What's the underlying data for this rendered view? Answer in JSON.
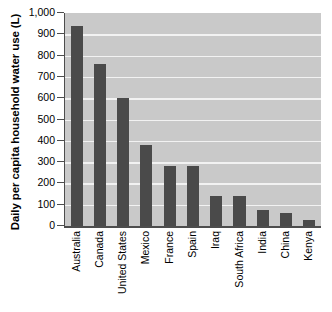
{
  "chart_data": {
    "type": "bar",
    "title": "",
    "xlabel": "",
    "ylabel": "Daily per capita household water use (L)",
    "ylim": [
      0,
      1000
    ],
    "ytick_labels": [
      "1,000",
      "900",
      "800",
      "700",
      "600",
      "500",
      "400",
      "300",
      "200",
      "100",
      "0"
    ],
    "ytick_values": [
      1000,
      900,
      800,
      700,
      600,
      500,
      400,
      300,
      200,
      100,
      0
    ],
    "grid": true,
    "legend": "none",
    "orientation": "vertical",
    "bar_color": "#4a4a4a",
    "plot_background": "#c9c9c9",
    "gridline_color": "#f2f2f2",
    "axis_color": "#4d4d4d",
    "page_background": "#ffffff",
    "xtick_rotation": 90,
    "categories": [
      "Australia",
      "Canada",
      "United States",
      "Mexico",
      "France",
      "Spain",
      "Iraq",
      "South Africa",
      "India",
      "China",
      "Kenya"
    ],
    "values": [
      940,
      760,
      600,
      380,
      280,
      280,
      140,
      140,
      75,
      60,
      30
    ]
  }
}
